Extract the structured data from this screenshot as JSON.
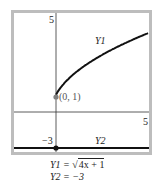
{
  "chart_data": {
    "type": "line",
    "title": "",
    "xlabel": "",
    "ylabel": "",
    "xlim": [
      -2.5,
      5
    ],
    "ylim": [
      -3.5,
      5.5
    ],
    "grid": false,
    "tick_labels": {
      "x_max": "5",
      "y_max": "5",
      "y2_value": "-3"
    },
    "series": [
      {
        "name": "Y1",
        "equation": "Y1 = √(4x + 1)",
        "x": [
          0,
          0.5,
          1,
          2,
          3,
          4,
          5
        ],
        "y": [
          1,
          1.73,
          2.24,
          3,
          3.61,
          4.12,
          4.58
        ],
        "color": "#111111"
      },
      {
        "name": "Y2",
        "equation": "Y2 = -3",
        "x": [
          -2.5,
          5
        ],
        "y": [
          -3,
          -3
        ],
        "color": "#111111"
      }
    ],
    "annotations": [
      {
        "text": "(0, 1)",
        "x": 0,
        "y": 1,
        "marker": "point",
        "color": "#777777"
      },
      {
        "text": "-3",
        "x": 0,
        "y": -3,
        "marker": "point",
        "color": "#111111"
      }
    ]
  },
  "labels": {
    "y_max": "5",
    "x_max": "5",
    "y1_name": "Y1",
    "y2_name": "Y2",
    "point_label": "(0, 1)",
    "y2_value": "−3"
  },
  "formulas": {
    "y1_lhs": "Y1 = ",
    "y1_radicand": "4x + 1",
    "y2": "Y2 =  −3"
  }
}
